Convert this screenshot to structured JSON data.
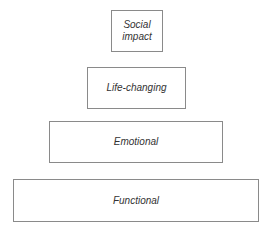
{
  "diagram": {
    "type": "pyramid",
    "levels": [
      {
        "label": "Social\nimpact",
        "line1": "Social",
        "line2": "impact"
      },
      {
        "label": "Life-changing"
      },
      {
        "label": "Emotional"
      },
      {
        "label": "Functional"
      }
    ]
  }
}
